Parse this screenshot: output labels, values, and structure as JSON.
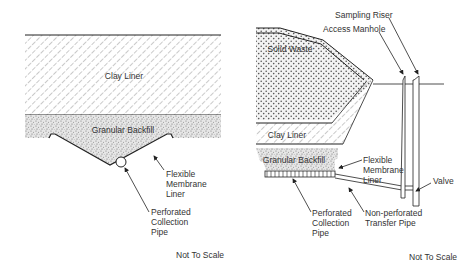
{
  "left_diagram": {
    "labels": {
      "clay_liner": "Clay Liner",
      "granular_backfill": "Granular Backfill",
      "membrane": [
        "Flexible",
        "Membrane",
        "Liner"
      ],
      "pipe": [
        "Perforated",
        "Collection",
        "Pipe"
      ],
      "scale": "Not To Scale"
    }
  },
  "right_diagram": {
    "labels": {
      "sampling_riser": "Sampling Riser",
      "access_manhole": "Access Manhole",
      "solid_waste": "Solid Waste",
      "clay_liner": "Clay Liner",
      "granular_backfill": "Granular Backfill",
      "membrane": [
        "Flexible",
        "Membrane",
        "Liner"
      ],
      "valve": "Valve",
      "pipe": [
        "Perforated",
        "Collection",
        "Pipe"
      ],
      "transfer_pipe": [
        "Non-perforated",
        "Transfer Pipe"
      ],
      "scale": "Not To Scale"
    }
  }
}
